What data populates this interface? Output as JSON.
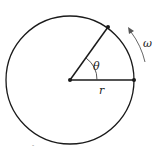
{
  "diagram": {
    "labels": {
      "angle": "θ",
      "radius": "r",
      "angular_velocity": "ω",
      "mark": "-"
    },
    "colors": {
      "stroke": "#1a1a1a",
      "arrow": "#555555"
    }
  }
}
